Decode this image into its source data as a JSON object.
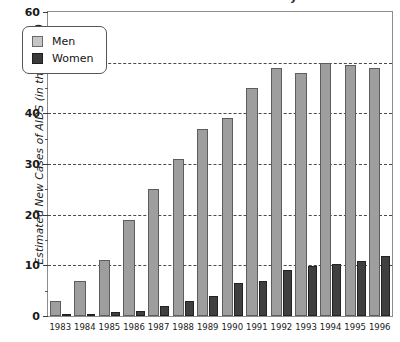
{
  "chart_data": {
    "type": "bar",
    "title": "Estimated New Cases of AIDS",
    "title_fragment_visible": "y",
    "xlabel": "",
    "ylabel": "Estimated New Cases of AIDS  (in thousands)",
    "categories": [
      "1983",
      "1984",
      "1985",
      "1986",
      "1987",
      "1988",
      "1989",
      "1990",
      "1991",
      "1992",
      "1993",
      "1994",
      "1995",
      "1996"
    ],
    "series": [
      {
        "name": "Men",
        "color": "#9e9e9e",
        "values": [
          3,
          7,
          11,
          19,
          25,
          31,
          37,
          39,
          45,
          49,
          48,
          50,
          49.5,
          49
        ]
      },
      {
        "name": "Women",
        "color": "#3f3f3f",
        "values": [
          0.2,
          0.4,
          0.7,
          1,
          2,
          3,
          4,
          6.5,
          7,
          9,
          9.8,
          10.3,
          10.8,
          11.8
        ]
      }
    ],
    "ylim": [
      0,
      60
    ],
    "y_major_ticks": [
      0,
      10,
      20,
      30,
      40,
      50,
      60
    ],
    "y_minor_ticks": [
      5,
      15,
      25,
      35,
      45,
      55
    ],
    "y_tick_labels": [
      "0",
      "10",
      "20",
      "30",
      "40",
      "50",
      "60"
    ],
    "gridlines": [
      10,
      20,
      30,
      40,
      50
    ],
    "grid": true,
    "grid_axis": "y",
    "grid_style": "dashed",
    "legend_position": "upper left",
    "legend_entries": [
      "Men",
      "Women"
    ]
  },
  "legend": {
    "men_label": "Men",
    "women_label": "Women"
  },
  "axes": {
    "y_title": "Estimated New Cases of AIDS  (in thousands)"
  }
}
